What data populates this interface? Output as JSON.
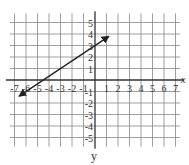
{
  "chart_data": {
    "type": "line",
    "title": "",
    "xlabel": "x",
    "ylabel": "y",
    "xlim": [
      -7.5,
      7.5
    ],
    "ylim": [
      -5.5,
      5.5
    ],
    "grid": true,
    "x_ticks": [
      "-7",
      "-6",
      "-5",
      "-4",
      "-3",
      "-2",
      "-1",
      "1",
      "2",
      "3",
      "4",
      "5",
      "6",
      "7"
    ],
    "y_ticks": [
      "5",
      "4",
      "3",
      "2",
      "1",
      "-1",
      "-2",
      "-3",
      "-4",
      "-5"
    ],
    "series": [
      {
        "name": "line",
        "x": [
          -6.6,
          1.2
        ],
        "y": [
          -1.4,
          3.8
        ],
        "arrows": "both",
        "slope": 0.6667,
        "intercept": 3
      }
    ]
  },
  "labels": {
    "x_axis": "x",
    "y_axis": "y"
  }
}
